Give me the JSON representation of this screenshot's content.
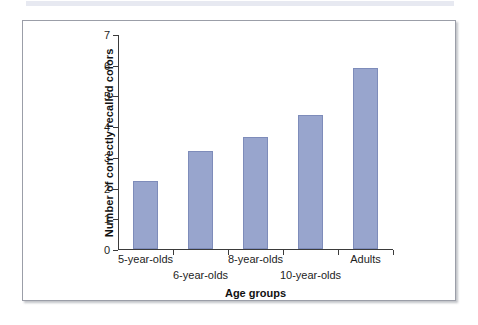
{
  "chart_data": {
    "type": "bar",
    "title": "",
    "xlabel": "Age groups",
    "ylabel": "Number of correctly recalled colors",
    "categories": [
      "5-year-olds",
      "6-year-olds",
      "8-year-olds",
      "10-year-olds",
      "Adults"
    ],
    "values": [
      2.2,
      3.2,
      3.65,
      4.35,
      5.9
    ],
    "ylim": [
      0,
      7
    ],
    "yticks": [
      0,
      1,
      2,
      3,
      4,
      5,
      6,
      7
    ],
    "ytick_labels": [
      "0",
      "1",
      "2",
      "3",
      "4",
      "5",
      "6",
      "7"
    ],
    "grid": false,
    "legend": null,
    "bar_color": "#98a5cd",
    "bar_border_color": "#7e8cba",
    "axis_color": "#3b3b3b",
    "label_stagger": [
      0,
      1,
      0,
      1,
      0
    ]
  },
  "figure": {
    "frame_border_color": "#9b9ea8",
    "background": "#ffffff"
  }
}
